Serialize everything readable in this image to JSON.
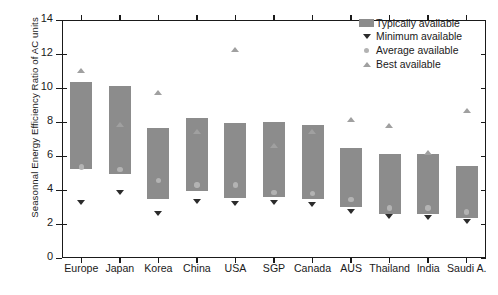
{
  "chart_data": {
    "type": "bar",
    "title": "",
    "xlabel": "",
    "ylabel": "Seasonnal Energy Efficiency Ratio of AC units",
    "ylim": [
      0,
      14
    ],
    "yticks": [
      0,
      2,
      4,
      6,
      8,
      10,
      12,
      14
    ],
    "grid": false,
    "legend_position": "top-right",
    "categories": [
      "Europe",
      "Japan",
      "Korea",
      "China",
      "USA",
      "SGP",
      "Canada",
      "AUS",
      "Thailand",
      "India",
      "Saudi A."
    ],
    "series": [
      {
        "name": "Typically available",
        "type": "floating-bar",
        "marker": "bar-swatch",
        "color": "#8c8c8c",
        "tops": [
          10.35,
          10.1,
          7.65,
          8.25,
          7.95,
          8.0,
          7.8,
          6.5,
          6.1,
          6.1,
          5.4
        ],
        "bottoms": [
          5.25,
          4.95,
          3.45,
          3.95,
          3.55,
          3.6,
          3.45,
          3.0,
          2.6,
          2.6,
          2.35
        ]
      },
      {
        "name": "Minimum available",
        "type": "point",
        "marker": "triangle-down",
        "color": "#2b2b2b",
        "values": [
          3.25,
          3.85,
          2.6,
          3.3,
          3.2,
          3.25,
          3.15,
          2.7,
          2.4,
          2.35,
          2.15
        ]
      },
      {
        "name": "Average available",
        "type": "point",
        "marker": "circle",
        "color": "#b3b3b3",
        "values": [
          5.35,
          5.2,
          4.55,
          4.3,
          4.3,
          3.85,
          3.8,
          3.45,
          2.95,
          2.95,
          2.7
        ]
      },
      {
        "name": "Best available",
        "type": "point",
        "marker": "triangle-up",
        "color": "#a0a0a0",
        "values": [
          11.0,
          7.85,
          9.7,
          7.45,
          12.25,
          6.6,
          7.4,
          8.15,
          7.8,
          6.2,
          8.65
        ]
      }
    ]
  },
  "legend": {
    "items": [
      {
        "label": "Typically available",
        "marker": "bar-swatch"
      },
      {
        "label": "Minimum available",
        "marker": "triangle-down"
      },
      {
        "label": "Average available",
        "marker": "circle"
      },
      {
        "label": "Best available",
        "marker": "triangle-up"
      }
    ]
  },
  "axis": {
    "y_title": "Seasonnal Energy Efficiency Ratio of AC units",
    "y_tick_labels": [
      "0",
      "2",
      "4",
      "6",
      "8",
      "10",
      "12",
      "14"
    ],
    "x_tick_labels": [
      "Europe",
      "Japan",
      "Korea",
      "China",
      "USA",
      "SGP",
      "Canada",
      "AUS",
      "Thailand",
      "India",
      "Saudi A."
    ]
  },
  "colors": {
    "bar": "#8c8c8c",
    "minimum": "#2b2b2b",
    "average": "#b3b3b3",
    "best": "#a0a0a0",
    "axis": "#1a1a1a",
    "background": "#ffffff"
  }
}
